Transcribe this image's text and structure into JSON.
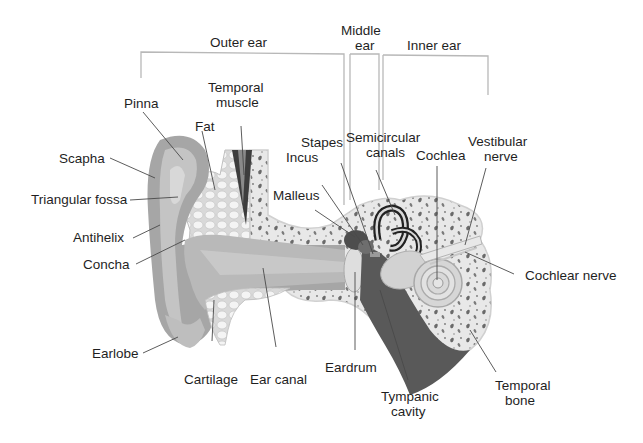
{
  "diagram": {
    "type": "anatomical-illustration",
    "colors": {
      "background": "#ffffff",
      "skin_outer": "#a9a9a9",
      "skin_inner": "#c8c8c8",
      "fat_cells": "#f2f2f2",
      "bone": "#e6e6e6",
      "bone_spots": "#6e6e6e",
      "muscle": "#4a4a4a",
      "tympanic_cavity": "#5a5a5a",
      "label_text": "#1f1f1f",
      "leader_line": "#555555",
      "bracket_line": "#b5b5b5"
    },
    "sections": [
      {
        "id": "outer",
        "label": "Outer ear"
      },
      {
        "id": "middle",
        "label_line1": "Middle",
        "label_line2": "ear"
      },
      {
        "id": "inner",
        "label": "Inner ear"
      }
    ],
    "labels": {
      "pinna": "Pinna",
      "temporal_muscle_1": "Temporal",
      "temporal_muscle_2": "muscle",
      "fat": "Fat",
      "scapha": "Scapha",
      "triangular_fossa": "Triangular fossa",
      "antihelix": "Antihelix",
      "concha": "Concha",
      "earlobe": "Earlobe",
      "cartilage": "Cartilage",
      "ear_canal": "Ear canal",
      "malleus": "Malleus",
      "incus": "Incus",
      "stapes": "Stapes",
      "semicircular_1": "Semicircular",
      "semicircular_2": "canals",
      "cochlea": "Cochlea",
      "vestibular_1": "Vestibular",
      "vestibular_2": "nerve",
      "cochlear_nerve": "Cochlear nerve",
      "eardrum": "Eardrum",
      "tympanic_1": "Tympanic",
      "tympanic_2": "cavity",
      "temporal_bone_1": "Temporal",
      "temporal_bone_2": "bone"
    }
  }
}
